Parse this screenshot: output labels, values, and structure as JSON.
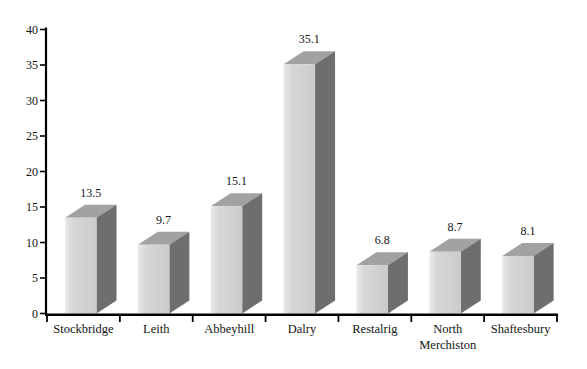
{
  "chart_data": {
    "type": "bar",
    "style": "3d-column",
    "title": "",
    "xlabel": "",
    "ylabel": "",
    "categories": [
      "Stockbridge",
      "Leith",
      "Abbeyhill",
      "Dalry",
      "Restalrig",
      "North Merchiston",
      "Shaftesbury"
    ],
    "category_lines": [
      [
        "Stockbridge"
      ],
      [
        "Leith"
      ],
      [
        "Abbeyhill"
      ],
      [
        "Dalry"
      ],
      [
        "Restalrig"
      ],
      [
        "North",
        "Merchiston"
      ],
      [
        "Shaftesbury"
      ]
    ],
    "values": [
      13.5,
      9.7,
      15.1,
      35.1,
      6.8,
      8.7,
      8.1
    ],
    "value_labels": [
      "13.5",
      "9.7",
      "15.1",
      "35.1",
      "6.8",
      "8.7",
      "8.1"
    ],
    "ylim": [
      0,
      40
    ],
    "yticks": [
      0,
      5,
      10,
      15,
      20,
      25,
      30,
      35,
      40
    ],
    "ytick_labels": [
      "0",
      "5",
      "10",
      "15",
      "20",
      "25",
      "30",
      "35",
      "40"
    ],
    "grid": false,
    "legend": false,
    "colors": {
      "background": "#ffffff",
      "bar_front_left": "#eaeaea",
      "bar_front_mid": "#d7d7d7",
      "bar_front_right": "#cbcbcb",
      "bar_top": "#a2a2a2",
      "bar_side": "#6e6e6e",
      "axis": "#000000",
      "text": "#141414"
    }
  }
}
